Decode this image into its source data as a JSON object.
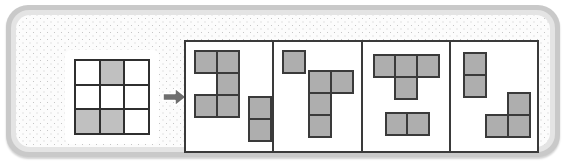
{
  "puzzle": {
    "title": "Shape decomposition puzzle",
    "arrow_icon": "arrow-right-icon",
    "colors": {
      "frame_outer": "#c9c9c9",
      "frame_mid": "#e4e4e4",
      "field_background": "#fcfcfc",
      "field_dots": "#c6c6c6",
      "block_fill": "#aeaeae",
      "block_stroke": "#3a3a3a",
      "grid_stroke": "#2f2f2f",
      "grid_filled_cell": "#c0c0c0",
      "grid_empty_cell": "#ffffff",
      "arrow_fill": "#6e6e6e"
    },
    "source_grid": {
      "rows": 3,
      "cols": 3,
      "cells": [
        [
          0,
          1,
          0
        ],
        [
          0,
          0,
          0
        ],
        [
          1,
          1,
          0
        ]
      ],
      "filled_count": 3
    },
    "options": [
      {
        "label": "A",
        "pieces": [
          {
            "name": "s-pentomino",
            "cell_count": 5,
            "cells": [
              [
                0,
                0
              ],
              [
                0,
                1
              ],
              [
                1,
                1
              ],
              [
                2,
                0
              ],
              [
                2,
                1
              ]
            ],
            "x": 8,
            "y": 8
          },
          {
            "name": "vertical-domino",
            "cell_count": 2,
            "cells": [
              [
                0,
                0
              ],
              [
                1,
                0
              ]
            ],
            "x": 62,
            "y": 54
          }
        ]
      },
      {
        "label": "B",
        "pieces": [
          {
            "name": "single-square",
            "cell_count": 1,
            "cells": [
              [
                0,
                0
              ]
            ],
            "x": 8,
            "y": 8
          },
          {
            "name": "j-tetromino",
            "cell_count": 4,
            "cells": [
              [
                0,
                0
              ],
              [
                0,
                1
              ],
              [
                1,
                0
              ],
              [
                2,
                0
              ]
            ],
            "x": 34,
            "y": 28
          }
        ]
      },
      {
        "label": "C",
        "pieces": [
          {
            "name": "t-tetromino",
            "cell_count": 4,
            "cells": [
              [
                0,
                0
              ],
              [
                0,
                1
              ],
              [
                0,
                2
              ],
              [
                1,
                1
              ]
            ],
            "x": 10,
            "y": 12
          },
          {
            "name": "horizontal-domino",
            "cell_count": 2,
            "cells": [
              [
                0,
                0
              ],
              [
                0,
                1
              ]
            ],
            "x": 22,
            "y": 70
          }
        ]
      },
      {
        "label": "D",
        "pieces": [
          {
            "name": "vertical-domino",
            "cell_count": 2,
            "cells": [
              [
                0,
                0
              ],
              [
                1,
                0
              ]
            ],
            "x": 12,
            "y": 10
          },
          {
            "name": "l-tromino",
            "cell_count": 3,
            "cells": [
              [
                0,
                1
              ],
              [
                1,
                0
              ],
              [
                1,
                1
              ]
            ],
            "x": 34,
            "y": 50
          }
        ]
      }
    ]
  }
}
